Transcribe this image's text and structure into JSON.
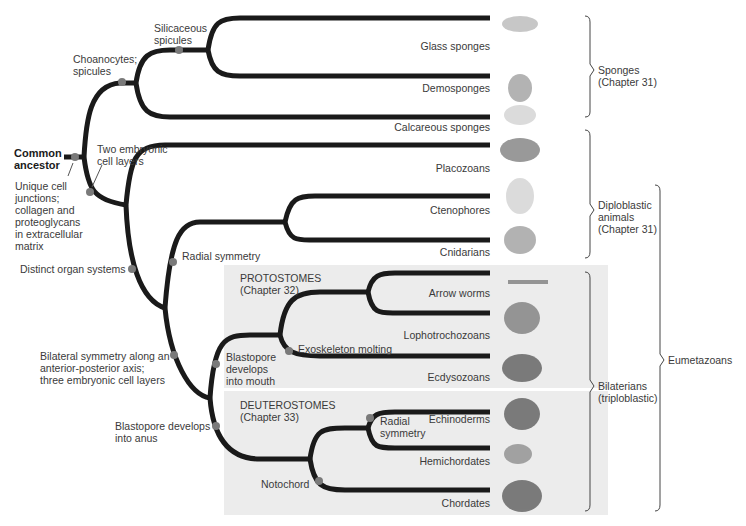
{
  "root": {
    "label": "Common\nancestor"
  },
  "characters": {
    "unique_cell_junctions": "Unique cell\njunctions;\ncollagen and\nproteoglycans\nin extracellular\nmatrix",
    "choanocytes": "Choanocytes;\nspicules",
    "siliceous": "Silicaceous\nspicules",
    "two_layers": "Two embryonic\ncell layers",
    "organ_systems": "Distinct organ systems",
    "radial_symmetry": "Radial symmetry",
    "bilateral": "Bilateral symmetry along an\nanterior-posterior axis;\nthree embryonic cell layers",
    "mouth": "Blastopore\ndevelops\ninto mouth",
    "molting": "Exoskeleton molting",
    "anus": "Blastopore develops\ninto anus",
    "radial2": "Radial\nsymmetry",
    "notochord": "Notochord"
  },
  "groups": {
    "protostomes": "PROTOSTOMES\n(Chapter 32)",
    "deuterostomes": "DEUTEROSTOMES\n(Chapter 33)"
  },
  "taxa": [
    "Glass sponges",
    "Demosponges",
    "Calcareous sponges",
    "Placozoans",
    "Ctenophores",
    "Cnidarians",
    "Arrow worms",
    "Lophotrochozoans",
    "Ecdysozoans",
    "Echinoderms",
    "Hemichordates",
    "Chordates"
  ],
  "brackets": {
    "sponges": "Sponges\n(Chapter 31)",
    "diploblastic": "Diploblastic\nanimals\n(Chapter 31)",
    "bilaterians": "Bilaterians\n(triploblastic)",
    "eumetazoans": "Eumetazoans"
  },
  "colors": {
    "branch": "#1a1a1a",
    "node": "#7a7a7a",
    "group_box": "#ececec"
  }
}
